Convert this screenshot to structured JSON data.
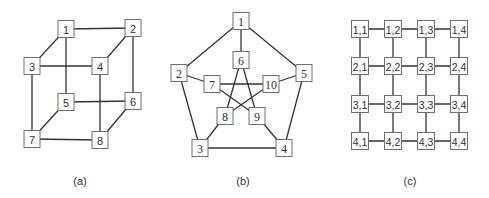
{
  "diagrams": [
    {
      "id": "cube",
      "caption": "(a)",
      "description": "3-dimensional hypercube (cube) graph",
      "nodes": [
        "1",
        "2",
        "3",
        "4",
        "5",
        "6",
        "7",
        "8"
      ],
      "edges": [
        [
          "1",
          "2"
        ],
        [
          "1",
          "3"
        ],
        [
          "1",
          "5"
        ],
        [
          "2",
          "4"
        ],
        [
          "2",
          "6"
        ],
        [
          "3",
          "4"
        ],
        [
          "3",
          "7"
        ],
        [
          "4",
          "8"
        ],
        [
          "5",
          "6"
        ],
        [
          "5",
          "7"
        ],
        [
          "6",
          "8"
        ],
        [
          "7",
          "8"
        ]
      ]
    },
    {
      "id": "petersen",
      "caption": "(b)",
      "description": "Petersen graph",
      "nodes": [
        "1",
        "2",
        "3",
        "4",
        "5",
        "6",
        "7",
        "8",
        "9",
        "10"
      ],
      "edges": [
        [
          "1",
          "2"
        ],
        [
          "2",
          "3"
        ],
        [
          "3",
          "4"
        ],
        [
          "4",
          "5"
        ],
        [
          "5",
          "1"
        ],
        [
          "1",
          "6"
        ],
        [
          "2",
          "7"
        ],
        [
          "3",
          "8"
        ],
        [
          "4",
          "9"
        ],
        [
          "5",
          "10"
        ],
        [
          "6",
          "8"
        ],
        [
          "8",
          "10"
        ],
        [
          "10",
          "7"
        ],
        [
          "7",
          "9"
        ],
        [
          "9",
          "6"
        ]
      ]
    },
    {
      "id": "mesh",
      "caption": "(c)",
      "description": "4x4 two-dimensional mesh graph",
      "nodes": [
        "1,1",
        "1,2",
        "1,3",
        "1,4",
        "2,1",
        "2,2",
        "2,3",
        "2,4",
        "3,1",
        "3,2",
        "3,3",
        "3,4",
        "4,1",
        "4,2",
        "4,3",
        "4,4"
      ],
      "edges": [
        [
          "1,1",
          "1,2"
        ],
        [
          "1,2",
          "1,3"
        ],
        [
          "1,3",
          "1,4"
        ],
        [
          "2,1",
          "2,2"
        ],
        [
          "2,2",
          "2,3"
        ],
        [
          "2,3",
          "2,4"
        ],
        [
          "3,1",
          "3,2"
        ],
        [
          "3,2",
          "3,3"
        ],
        [
          "3,3",
          "3,4"
        ],
        [
          "4,1",
          "4,2"
        ],
        [
          "4,2",
          "4,3"
        ],
        [
          "4,3",
          "4,4"
        ],
        [
          "1,1",
          "2,1"
        ],
        [
          "2,1",
          "3,1"
        ],
        [
          "3,1",
          "4,1"
        ],
        [
          "1,2",
          "2,2"
        ],
        [
          "2,2",
          "3,2"
        ],
        [
          "3,2",
          "4,2"
        ],
        [
          "1,3",
          "2,3"
        ],
        [
          "2,3",
          "3,3"
        ],
        [
          "3,3",
          "4,3"
        ],
        [
          "1,4",
          "2,4"
        ],
        [
          "2,4",
          "3,4"
        ],
        [
          "3,4",
          "4,4"
        ]
      ]
    }
  ]
}
